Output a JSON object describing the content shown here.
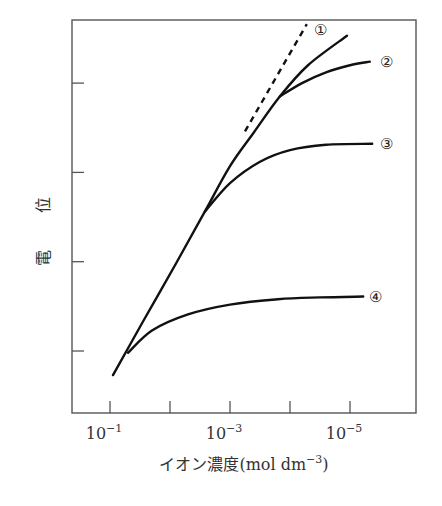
{
  "chart_data": {
    "type": "line",
    "title": "",
    "xlabel": "イオン濃度(mol dm⁻³)",
    "xlabel_parts": {
      "main": "イオン濃度(mol dm",
      "sup": "−3",
      "close": ")"
    },
    "ylabel": "電 位",
    "ylabel_chars": [
      "電",
      "位"
    ],
    "x_scale": "log (decreasing concentration to the right)",
    "x_axis_unit": "-log10 concentration",
    "xlim": [
      0.97,
      6.1
    ],
    "ylim": [
      0.3,
      4.8
    ],
    "x_ticks": [
      1,
      2,
      3,
      4,
      5
    ],
    "x_tick_labels": [
      {
        "value": 1,
        "base": "10",
        "exp": "−1"
      },
      {
        "value": 3,
        "base": "10",
        "exp": "−3"
      },
      {
        "value": 5,
        "base": "10",
        "exp": "−5"
      }
    ],
    "y_ticks": [
      1,
      2,
      3,
      4
    ],
    "y_tick_labels": [],
    "grid": false,
    "legend": "none (curves labeled inline)",
    "series": [
      {
        "name": "①",
        "style": "solid",
        "points": [
          [
            1.05,
            0.73
          ],
          [
            1.55,
            1.33
          ],
          [
            2.1,
            1.98
          ],
          [
            2.58,
            2.56
          ],
          [
            3.0,
            3.07
          ],
          [
            3.4,
            3.45
          ],
          [
            3.83,
            3.85
          ],
          [
            4.3,
            4.2
          ],
          [
            4.95,
            4.53
          ]
        ]
      },
      {
        "name": "②",
        "style": "solid",
        "points": [
          [
            3.83,
            3.85
          ],
          [
            4.2,
            4.0
          ],
          [
            4.6,
            4.12
          ],
          [
            5.0,
            4.2
          ],
          [
            5.33,
            4.24
          ]
        ]
      },
      {
        "name": "③",
        "style": "solid",
        "points": [
          [
            2.58,
            2.56
          ],
          [
            3.0,
            2.88
          ],
          [
            3.5,
            3.12
          ],
          [
            4.0,
            3.25
          ],
          [
            4.6,
            3.31
          ],
          [
            5.37,
            3.32
          ]
        ]
      },
      {
        "name": "④",
        "style": "solid",
        "points": [
          [
            1.3,
            0.98
          ],
          [
            1.7,
            1.23
          ],
          [
            2.3,
            1.41
          ],
          [
            3.0,
            1.52
          ],
          [
            3.8,
            1.58
          ],
          [
            4.5,
            1.6
          ],
          [
            5.22,
            1.61
          ]
        ]
      },
      {
        "name": "ideal",
        "style": "dashed",
        "points": [
          [
            3.25,
            3.46
          ],
          [
            4.28,
            4.66
          ]
        ]
      }
    ],
    "annotations": [
      {
        "text": "①",
        "x": 4.5,
        "y": 4.6
      },
      {
        "text": "②",
        "x": 5.6,
        "y": 4.24
      },
      {
        "text": "③",
        "x": 5.6,
        "y": 3.32
      },
      {
        "text": "④",
        "x": 5.42,
        "y": 1.61
      }
    ]
  }
}
